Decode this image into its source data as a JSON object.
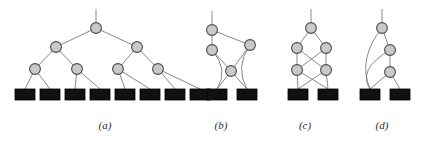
{
  "figure": {
    "background": "#ffffff",
    "width": 424,
    "height": 151,
    "style": {
      "node_fill": "#c9c9c9",
      "node_stroke": "#4a4a4a",
      "node_radius": 5.4,
      "node_stroke_width": 1.1,
      "edge_color": "#7a7a7a",
      "edge_width": 0.9,
      "leaf_fill": "#111111",
      "leaf_stroke": "#000000",
      "leaf_width": 20,
      "leaf_height": 11,
      "caption_color": "#2b2b2b"
    }
  },
  "captions": {
    "a": "(a)",
    "b": "(b)",
    "c": "(c)",
    "d": "(d)"
  },
  "panels": [
    {
      "id": "a",
      "label": "(a)",
      "description": "complete binary tree of depth 3 over 8 leaves",
      "caption_x": 105,
      "caption_y": 127,
      "root_stub": {
        "x": 96,
        "y_top": 9,
        "y_bottom": 23
      },
      "nodes": [
        {
          "name": "a-root",
          "x": 96,
          "y": 28
        },
        {
          "name": "a-l1-0",
          "x": 56,
          "y": 47
        },
        {
          "name": "a-l1-1",
          "x": 137,
          "y": 47
        },
        {
          "name": "a-l2-0",
          "x": 35,
          "y": 69
        },
        {
          "name": "a-l2-1",
          "x": 77,
          "y": 69
        },
        {
          "name": "a-l2-2",
          "x": 118,
          "y": 69
        },
        {
          "name": "a-l2-3",
          "x": 158,
          "y": 69
        }
      ],
      "leaves": [
        {
          "name": "a-leaf-0",
          "x": 15,
          "y": 89
        },
        {
          "name": "a-leaf-1",
          "x": 40,
          "y": 89
        },
        {
          "name": "a-leaf-2",
          "x": 65,
          "y": 89
        },
        {
          "name": "a-leaf-3",
          "x": 90,
          "y": 89
        },
        {
          "name": "a-leaf-4",
          "x": 115,
          "y": 89
        },
        {
          "name": "a-leaf-5",
          "x": 140,
          "y": 89
        },
        {
          "name": "a-leaf-6",
          "x": 165,
          "y": 89
        },
        {
          "name": "a-leaf-7",
          "x": 190,
          "y": 89
        }
      ],
      "edges": [
        {
          "from": "a-root",
          "to": "a-l1-0"
        },
        {
          "from": "a-root",
          "to": "a-l1-1"
        },
        {
          "from": "a-l1-0",
          "to": "a-l2-0"
        },
        {
          "from": "a-l1-0",
          "to": "a-l2-1"
        },
        {
          "from": "a-l1-1",
          "to": "a-l2-2"
        },
        {
          "from": "a-l1-1",
          "to": "a-l2-3"
        },
        {
          "from": "a-l2-0",
          "to": "a-leaf-0"
        },
        {
          "from": "a-l2-0",
          "to": "a-leaf-1"
        },
        {
          "from": "a-l2-1",
          "to": "a-leaf-2"
        },
        {
          "from": "a-l2-1",
          "to": "a-leaf-3"
        },
        {
          "from": "a-l2-2",
          "to": "a-leaf-4"
        },
        {
          "from": "a-l2-2",
          "to": "a-leaf-5"
        },
        {
          "from": "a-l2-3",
          "to": "a-leaf-6"
        },
        {
          "from": "a-l2-3",
          "to": "a-leaf-7"
        }
      ]
    },
    {
      "id": "b",
      "label": "(b)",
      "description": "four-node graph with curved edges over 2 leaves",
      "caption_x": 221,
      "caption_y": 127,
      "root_stub": {
        "x": 212,
        "y_top": 11,
        "y_bottom": 25
      },
      "nodes": [
        {
          "name": "b-n0",
          "x": 212,
          "y": 30
        },
        {
          "name": "b-n1",
          "x": 212,
          "y": 50
        },
        {
          "name": "b-n2",
          "x": 250,
          "y": 45
        },
        {
          "name": "b-n3",
          "x": 231,
          "y": 71
        }
      ],
      "leaves": [
        {
          "name": "b-leaf-0",
          "x": 207,
          "y": 89
        },
        {
          "name": "b-leaf-1",
          "x": 237,
          "y": 89
        }
      ],
      "edges": [
        {
          "from": "b-n0",
          "to": "b-n1"
        },
        {
          "from": "b-n0",
          "to": "b-n2"
        },
        {
          "from": "b-n1",
          "to": "b-n3"
        },
        {
          "from": "b-n2",
          "to": "b-n3"
        },
        {
          "from": "b-n3",
          "to": "b-leaf-0"
        },
        {
          "from": "b-n3",
          "to": "b-leaf-1"
        },
        {
          "from": "b-n1",
          "to": "b-leaf-0",
          "curved": true
        },
        {
          "from": "b-n2",
          "to": "b-leaf-1",
          "curved": true
        }
      ]
    },
    {
      "id": "c",
      "label": "(c)",
      "description": "butterfly network with crossing edges over 2 leaves",
      "caption_x": 305,
      "caption_y": 127,
      "root_stub": {
        "x": 311,
        "y_top": 9,
        "y_bottom": 23
      },
      "nodes": [
        {
          "name": "c-root",
          "x": 311,
          "y": 28
        },
        {
          "name": "c-m0",
          "x": 297,
          "y": 48
        },
        {
          "name": "c-m1",
          "x": 326,
          "y": 48
        },
        {
          "name": "c-b0",
          "x": 297,
          "y": 70
        },
        {
          "name": "c-b1",
          "x": 326,
          "y": 70
        }
      ],
      "leaves": [
        {
          "name": "c-leaf-0",
          "x": 288,
          "y": 89
        },
        {
          "name": "c-leaf-1",
          "x": 318,
          "y": 89
        }
      ],
      "edges": [
        {
          "from": "c-root",
          "to": "c-m0"
        },
        {
          "from": "c-root",
          "to": "c-m1"
        },
        {
          "from": "c-m0",
          "to": "c-b0"
        },
        {
          "from": "c-m0",
          "to": "c-b1"
        },
        {
          "from": "c-m1",
          "to": "c-b0"
        },
        {
          "from": "c-m1",
          "to": "c-b1"
        },
        {
          "from": "c-b0",
          "to": "c-leaf-0"
        },
        {
          "from": "c-b0",
          "to": "c-leaf-1"
        },
        {
          "from": "c-b1",
          "to": "c-leaf-0"
        },
        {
          "from": "c-b1",
          "to": "c-leaf-1"
        }
      ]
    },
    {
      "id": "d",
      "label": "(d)",
      "description": "vertical chain with long curved edges into left leaf",
      "caption_x": 382,
      "caption_y": 127,
      "root_stub": {
        "x": 382,
        "y_top": 9,
        "y_bottom": 23
      },
      "nodes": [
        {
          "name": "d-n0",
          "x": 382,
          "y": 28
        },
        {
          "name": "d-n1",
          "x": 390,
          "y": 50
        },
        {
          "name": "d-n2",
          "x": 390,
          "y": 72
        }
      ],
      "leaves": [
        {
          "name": "d-leaf-0",
          "x": 360,
          "y": 89
        },
        {
          "name": "d-leaf-1",
          "x": 390,
          "y": 89
        }
      ],
      "edges": [
        {
          "from": "d-n0",
          "to": "d-n1"
        },
        {
          "from": "d-n1",
          "to": "d-n2"
        },
        {
          "from": "d-n2",
          "to": "d-leaf-0"
        },
        {
          "from": "d-n2",
          "to": "d-leaf-1"
        },
        {
          "from": "d-n0",
          "to": "d-leaf-0",
          "curved": true
        },
        {
          "from": "d-n1",
          "to": "d-leaf-0",
          "curved": true
        }
      ]
    }
  ]
}
